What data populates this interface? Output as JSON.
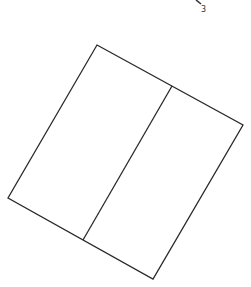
{
  "diagram": {
    "type": "rotated rectangle divided into two panels",
    "stroke_color": "#2a2a2a",
    "background": "#ffffff",
    "outer_shape": {
      "corners": [
        [
          97,
          45
        ],
        [
          243,
          125
        ],
        [
          153,
          279
        ],
        [
          8,
          198
        ]
      ]
    },
    "divider": {
      "from": [
        172,
        86
      ],
      "to": [
        83,
        240
      ]
    },
    "labels": [
      {
        "text": "3",
        "x": 201,
        "y": 12
      }
    ],
    "fragment_mark": {
      "from": [
        196,
        0
      ],
      "to": [
        201,
        4
      ]
    }
  }
}
